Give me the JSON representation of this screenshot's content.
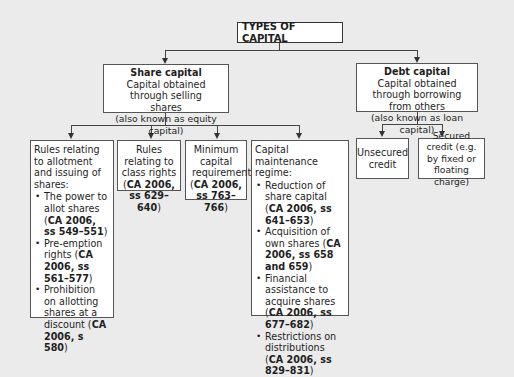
{
  "diagram": {
    "title": "TYPES OF CAPITAL",
    "share_capital": {
      "heading": "Share capital",
      "description": "Capital obtained through selling shares",
      "note": "(also known as equity capital)",
      "children": [
        {
          "intro": "Rules relating to allotment and issuing of shares:",
          "bullets": [
            {
              "text": "The power to allot shares (",
              "ref": "CA 2006, ss 549–551",
              "end": ")"
            },
            {
              "text": "Pre-emption rights (",
              "ref": "CA 2006, ss 561–577",
              "end": ")"
            },
            {
              "text": "Prohibition on allotting shares at a discount (",
              "ref": "CA 2006, s 580",
              "end": ")"
            }
          ]
        },
        {
          "intro": "Rules relating to class rights",
          "ref_open": "(",
          "ref": "CA 2006, ss 629–640",
          "ref_close": ")"
        },
        {
          "intro": "Minimum capital requirement",
          "ref_open": "(",
          "ref": "CA 2006, ss 763–766",
          "ref_close": ")"
        },
        {
          "intro": "Capital maintenance regime:",
          "bullets": [
            {
              "text": "Reduction of share capital (",
              "ref": "CA 2006, ss 641–653",
              "end": ")"
            },
            {
              "text": "Acquisition of own shares (",
              "ref": "CA 2006, ss 658 and 659",
              "end": ")"
            },
            {
              "text": "Financial assistance to acquire shares (",
              "ref": "CA 2006, ss 677–682",
              "end": ")"
            },
            {
              "text": "Restrictions on distributions (",
              "ref": "CA 2006, ss 829–831",
              "end": ")"
            }
          ]
        }
      ]
    },
    "debt_capital": {
      "heading": "Debt capital",
      "description": "Capital obtained through borrowing from others",
      "note": "(also known as loan capital)",
      "children": [
        {
          "text": "Unsecured credit"
        },
        {
          "text": "Secured credit (e.g. by fixed or floating charge)"
        }
      ]
    }
  },
  "colors": {
    "background": "#ebebeb",
    "box_fill": "#ffffff",
    "line": "#444444"
  }
}
